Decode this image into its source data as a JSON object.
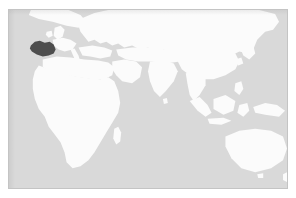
{
  "map": {
    "title": "World locator map",
    "projection": "equirectangular",
    "extent_label": "Eastern Hemisphere centered world map",
    "colors": {
      "page_background": "#ffffff",
      "ocean": "#d9d9d9",
      "land": "#fbfbfb",
      "land_soft": "#f4f4f4",
      "highlight": "#4d4d4d",
      "frame_border": "#c4c4c4"
    },
    "frame": {
      "left": 8,
      "top": 9,
      "width": 280,
      "height": 180,
      "border_width": 1
    },
    "highlight": {
      "name": "Iberian Peninsula",
      "label": "Spain",
      "approx_pixel_center_x": 40,
      "approx_pixel_center_y": 42,
      "fill": "#4d4d4d"
    },
    "visible_landmasses": [
      "Europe",
      "Africa",
      "Asia",
      "Arabian Peninsula",
      "Indian Subcontinent",
      "Southeast Asia",
      "Indonesia",
      "New Guinea",
      "Australia",
      "Japan",
      "Madagascar",
      "British Isles",
      "Scandinavia",
      "Greenland edge",
      "Sri Lanka"
    ],
    "visible_waterbodies": [
      "Atlantic Ocean",
      "Mediterranean Sea",
      "Black Sea",
      "Red Sea",
      "Indian Ocean",
      "Pacific Ocean",
      "Caspian Sea"
    ],
    "legend": [],
    "labels": [],
    "scalebar": null,
    "compass": null
  }
}
